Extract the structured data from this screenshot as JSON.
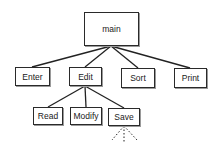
{
  "diagram": {
    "type": "structure-chart",
    "root": {
      "id": "main",
      "label": "main"
    },
    "level1": [
      {
        "id": "enter",
        "label": "Enter"
      },
      {
        "id": "edit",
        "label": "Edit"
      },
      {
        "id": "sort",
        "label": "Sort"
      },
      {
        "id": "print",
        "label": "Print"
      }
    ],
    "level2": [
      {
        "id": "read",
        "label": "Read",
        "parent": "edit"
      },
      {
        "id": "modify",
        "label": "Modify",
        "parent": "edit"
      },
      {
        "id": "save",
        "label": "Save",
        "parent": "edit"
      }
    ],
    "edges": [
      [
        "main",
        "enter"
      ],
      [
        "main",
        "edit"
      ],
      [
        "main",
        "sort"
      ],
      [
        "main",
        "print"
      ],
      [
        "edit",
        "read"
      ],
      [
        "edit",
        "modify"
      ],
      [
        "edit",
        "save"
      ]
    ],
    "continuation": {
      "from": "save",
      "style": "dashed",
      "count": 3
    }
  }
}
